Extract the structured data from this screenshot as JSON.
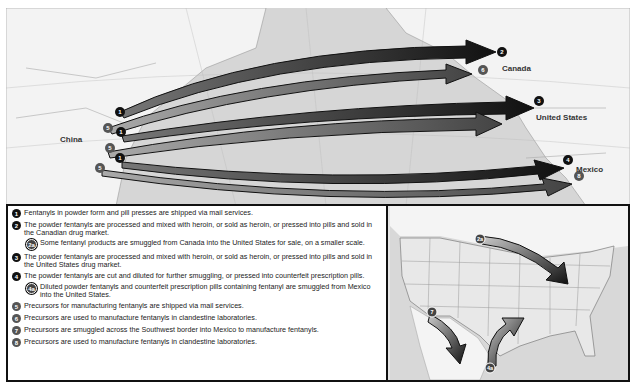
{
  "main_map": {
    "labels": {
      "china": "China",
      "canada": "Canada",
      "united_states": "United States",
      "mexico": "Mexico"
    },
    "routes": [
      {
        "from_marker": "1",
        "to_marker": "2",
        "destination": "Canada"
      },
      {
        "from_marker": "5",
        "to_marker": "6",
        "destination": "Canada"
      },
      {
        "from_marker": "1",
        "to_marker": "3",
        "destination": "United States"
      },
      {
        "from_marker": "5",
        "to_marker": "",
        "destination": "United States"
      },
      {
        "from_marker": "1",
        "to_marker": "4",
        "destination": "Mexico"
      },
      {
        "from_marker": "5",
        "to_marker": "8",
        "destination": "Mexico"
      }
    ]
  },
  "inset_map": {
    "markers": [
      "2a",
      "7",
      "4a"
    ]
  },
  "legend": {
    "items": [
      {
        "marker": "1",
        "text": "Fentanyls in powder form and pill presses are shipped via mail services."
      },
      {
        "marker": "2",
        "text": "The powder fentanyls are processed and mixed with heroin, or sold as heroin, or pressed into pills and sold in the Canadian drug market."
      },
      {
        "marker": "2a",
        "text": "Some fentanyl products are smuggled from Canada into the United States for sale, on a smaller scale."
      },
      {
        "marker": "3",
        "text": "The powder fentanyls are processed and mixed with heroin, or sold as heroin, or pressed into pills and sold in the United States drug market."
      },
      {
        "marker": "4",
        "text": "The powder fentanyls are cut and diluted for further smuggling, or pressed into counterfeit prescription pills."
      },
      {
        "marker": "4a",
        "text": "Diluted powder fentanyls and counterfeit prescription pills containing fentanyl are smuggled from Mexico into the United States."
      },
      {
        "marker": "5",
        "text": "Precursors for manufacturing fentanyls are shipped via mail services."
      },
      {
        "marker": "6",
        "text": "Precursors are used to manufacture fentanyls in clandestine laboratories."
      },
      {
        "marker": "7",
        "text": "Precursors are smuggled across the Southwest border into Mexico to manufacture fentanyls."
      },
      {
        "marker": "8",
        "text": "Precursors are used to manufacture fentanyls in clandestine laboratories."
      }
    ]
  },
  "colors": {
    "arrow_dark": "#1a1a1a",
    "arrow_grey": "#6a6a6a",
    "ocean": "#d4d4d4",
    "land": "#f2f2f2",
    "border": "#111111"
  }
}
